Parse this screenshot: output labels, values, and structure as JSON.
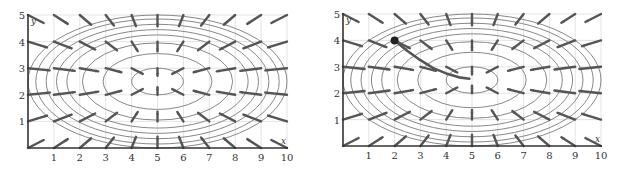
{
  "chart_data": [
    {
      "type": "vector-field-contour",
      "title": "",
      "xlabel": "x",
      "ylabel": "y",
      "xlim": [
        0,
        10
      ],
      "ylim": [
        0,
        5
      ],
      "x_ticks": [
        "1",
        "2",
        "3",
        "4",
        "5",
        "6",
        "7",
        "8",
        "9",
        "10"
      ],
      "y_ticks": [
        "1",
        "2",
        "3",
        "4",
        "5"
      ],
      "grid": true,
      "contour_center": [
        5,
        2.5
      ],
      "contour_semi_axes": [
        [
          1.0,
          0.5
        ],
        [
          2.1,
          1.05
        ],
        [
          2.9,
          1.45
        ],
        [
          3.5,
          1.75
        ],
        [
          3.9,
          1.95
        ],
        [
          4.3,
          2.15
        ],
        [
          4.7,
          2.35
        ],
        [
          5.0,
          2.5
        ]
      ],
      "vector_field": "gradient descent vectors pointing toward center (5, 2.5), grid at x=0..10 step 1, y=0..5 step ~0.8",
      "path": null
    },
    {
      "type": "vector-field-contour",
      "title": "",
      "xlabel": "x",
      "ylabel": "y",
      "xlim": [
        0,
        10
      ],
      "ylim": [
        0,
        5
      ],
      "x_ticks": [
        "1",
        "2",
        "3",
        "4",
        "5",
        "6",
        "7",
        "8",
        "9",
        "10"
      ],
      "y_ticks": [
        "1",
        "2",
        "3",
        "4",
        "5"
      ],
      "grid": true,
      "contour_center": [
        5,
        2.5
      ],
      "contour_semi_axes": [
        [
          1.0,
          0.5
        ],
        [
          2.1,
          1.05
        ],
        [
          2.9,
          1.45
        ],
        [
          3.5,
          1.75
        ],
        [
          3.9,
          1.95
        ],
        [
          4.3,
          2.15
        ],
        [
          4.7,
          2.35
        ],
        [
          5.0,
          2.5
        ]
      ],
      "vector_field": "gradient descent vectors pointing toward center (5, 2.5)",
      "path": {
        "start": [
          2.0,
          4.0
        ],
        "end": [
          4.9,
          2.55
        ],
        "points": [
          [
            2.0,
            4.0
          ],
          [
            2.5,
            3.6
          ],
          [
            3.0,
            3.25
          ],
          [
            3.5,
            2.95
          ],
          [
            4.0,
            2.75
          ],
          [
            4.5,
            2.6
          ],
          [
            4.9,
            2.55
          ]
        ],
        "marker": "start-dot"
      }
    }
  ],
  "plots": [
    {
      "id": "left",
      "x_label": "x",
      "y_label": "y"
    },
    {
      "id": "right",
      "x_label": "x",
      "y_label": "y"
    }
  ],
  "colors": {
    "axis": "#333333",
    "grid": "#d9d9d9",
    "contour": "#888888",
    "arrow": "#555555",
    "path": "#555555",
    "dot": "#222222"
  }
}
